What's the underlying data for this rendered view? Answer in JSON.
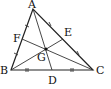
{
  "diagram": {
    "points": {
      "A": {
        "label": "A",
        "x": 33,
        "y": 9
      },
      "B": {
        "label": "B",
        "x": 11,
        "y": 70
      },
      "C": {
        "label": "C",
        "x": 93,
        "y": 70
      },
      "D": {
        "label": "D",
        "x": 52,
        "y": 70
      },
      "E": {
        "label": "E",
        "x": 63,
        "y": 39
      },
      "F": {
        "label": "F",
        "x": 22,
        "y": 39
      },
      "G": {
        "label": "G",
        "x": 46,
        "y": 49
      }
    },
    "segments": [
      "AB",
      "BC",
      "CA",
      "AD",
      "BE",
      "CF"
    ],
    "tick_marks": [
      "AF",
      "FB",
      "AE",
      "EC",
      "BD",
      "DC"
    ],
    "line_color": "#222222"
  }
}
